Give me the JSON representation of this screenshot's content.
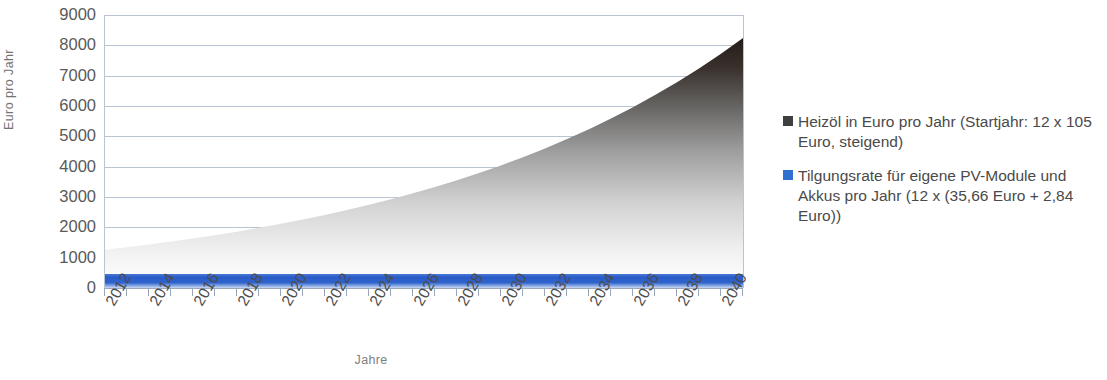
{
  "chart_data": {
    "type": "area",
    "title": "",
    "xlabel": "Jahre",
    "ylabel": "Euro pro Jahr",
    "ylim": [
      0,
      9000
    ],
    "xlim": [
      2012,
      2041
    ],
    "grid": true,
    "legend_position": "right",
    "y_ticks": [
      9000,
      8000,
      7000,
      6000,
      5000,
      4000,
      3000,
      2000,
      1000,
      0
    ],
    "x_ticks": [
      2012,
      2014,
      2016,
      2018,
      2020,
      2022,
      2024,
      2026,
      2028,
      2030,
      2032,
      2034,
      2036,
      2038,
      2040
    ],
    "x_all_years": [
      2012,
      2013,
      2014,
      2015,
      2016,
      2017,
      2018,
      2019,
      2020,
      2021,
      2022,
      2023,
      2024,
      2025,
      2026,
      2027,
      2028,
      2029,
      2030,
      2031,
      2032,
      2033,
      2034,
      2035,
      2036,
      2037,
      2038,
      2039,
      2040,
      2041
    ],
    "series": [
      {
        "name": "Heizöl in Euro pro Jahr (Startjahr: 12 x 105 Euro, steigend)",
        "color": "#3f3f3f",
        "values": [
          1260,
          1344,
          1434,
          1530,
          1633,
          1742,
          1858,
          1983,
          2115,
          2257,
          2408,
          2569,
          2741,
          2924,
          3120,
          3329,
          3551,
          3789,
          4042,
          4313,
          4601,
          4909,
          5237,
          5588,
          5962,
          6361,
          6786,
          7240,
          7725,
          8242
        ]
      },
      {
        "name": "Tilgungsrate für eigene PV-Module und Akkus pro Jahr (12 x (35,66 Euro + 2,84 Euro))",
        "color": "#2a5cc8",
        "values": [
          462,
          462,
          462,
          462,
          462,
          462,
          462,
          462,
          462,
          462,
          462,
          462,
          462,
          462,
          462,
          462,
          462,
          462,
          462,
          462,
          462,
          462,
          462,
          462,
          462,
          462,
          462,
          462,
          462,
          462
        ]
      }
    ]
  },
  "axes": {
    "y_title": "Euro pro Jahr",
    "x_title": "Jahre",
    "y_tick_labels": [
      "9000",
      "8000",
      "7000",
      "6000",
      "5000",
      "4000",
      "3000",
      "2000",
      "1000",
      "0"
    ],
    "x_tick_labels": [
      "2012",
      "2014",
      "2016",
      "2018",
      "2020",
      "2022",
      "2024",
      "2026",
      "2028",
      "2030",
      "2032",
      "2034",
      "2036",
      "2038",
      "2040"
    ]
  },
  "legend": {
    "entries": [
      {
        "label": "Heizöl in Euro pro Jahr (Startjahr: 12 x 105 Euro, steigend)",
        "color": "#3f3f3f"
      },
      {
        "label": "Tilgungsrate für eigene PV-Module und Akkus pro Jahr (12 x (35,66 Euro + 2,84 Euro))",
        "color": "#2f6fd0"
      }
    ]
  },
  "colors": {
    "gridline": "#b9c3d2",
    "axis": "#9aa7b8",
    "tick_text": "#4c4c4c",
    "title_text": "#808080",
    "background": "#ffffff",
    "area_dark": "#2b2320",
    "area_light": "#ffffff",
    "blue_band": "#2a5cc8"
  }
}
